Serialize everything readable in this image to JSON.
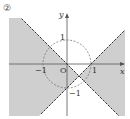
{
  "problem_label": "②",
  "axes": {
    "x_label": "x",
    "y_label": "y",
    "origin_label": "O"
  },
  "ticks": {
    "x_pos": "1",
    "x_neg": "−1",
    "y_pos": "1",
    "y_neg": "−1"
  },
  "figure": {
    "circle": {
      "center": [
        0,
        0
      ],
      "radius": 1,
      "style": "dashed"
    },
    "lines": [
      {
        "equation": "y = -x",
        "style": "dashed"
      },
      {
        "equation": "y = x - 1",
        "style": "dashed"
      }
    ],
    "shaded_region": "left and right wedges between the two lines",
    "colors": {
      "shade": "#cfcfcf",
      "line": "#444444",
      "axis": "#555555"
    }
  }
}
